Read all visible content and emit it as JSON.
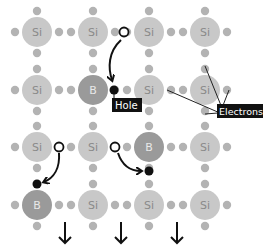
{
  "diagram": {
    "colors": {
      "si_atom": "#c8c8c8",
      "si_text": "#8a8a8a",
      "b_atom": "#9a9a9a",
      "b_text": "#e8e8e8",
      "electron": "#b3b3b3",
      "hole": "#111111",
      "label_bg": "#111111",
      "label_text": "#ffffff",
      "arrow": "#111111"
    },
    "grid": {
      "cols_x": [
        37,
        93,
        149,
        205
      ],
      "rows_y": [
        32,
        90,
        147,
        205
      ],
      "atom_radius": 15
    },
    "atoms": [
      {
        "row": 0,
        "col": 0,
        "symbol": "Si"
      },
      {
        "row": 0,
        "col": 1,
        "symbol": "Si"
      },
      {
        "row": 0,
        "col": 2,
        "symbol": "Si"
      },
      {
        "row": 0,
        "col": 3,
        "symbol": "Si"
      },
      {
        "row": 1,
        "col": 0,
        "symbol": "Si"
      },
      {
        "row": 1,
        "col": 1,
        "symbol": "B"
      },
      {
        "row": 1,
        "col": 2,
        "symbol": "Si"
      },
      {
        "row": 1,
        "col": 3,
        "symbol": "Si"
      },
      {
        "row": 2,
        "col": 0,
        "symbol": "Si"
      },
      {
        "row": 2,
        "col": 1,
        "symbol": "Si"
      },
      {
        "row": 2,
        "col": 2,
        "symbol": "B"
      },
      {
        "row": 2,
        "col": 3,
        "symbol": "Si"
      },
      {
        "row": 3,
        "col": 0,
        "symbol": "B"
      },
      {
        "row": 3,
        "col": 1,
        "symbol": "Si"
      },
      {
        "row": 3,
        "col": 2,
        "symbol": "Si"
      },
      {
        "row": 3,
        "col": 3,
        "symbol": "Si"
      }
    ],
    "labels": {
      "hole": "Hole",
      "electrons": "Electrons"
    },
    "hole_transitions": [
      {
        "from": "empty site right of Si (row 0, col 1)",
        "to": "hole left of B (row 1, col 1)"
      },
      {
        "from": "empty site right of Si (row 2, col 0)",
        "to": "hole above B (row 3, col 0)"
      },
      {
        "from": "empty site right of Si (row 2, col 1)",
        "to": "hole below B (row 2, col 2)"
      }
    ],
    "down_arrows_count": 3
  }
}
